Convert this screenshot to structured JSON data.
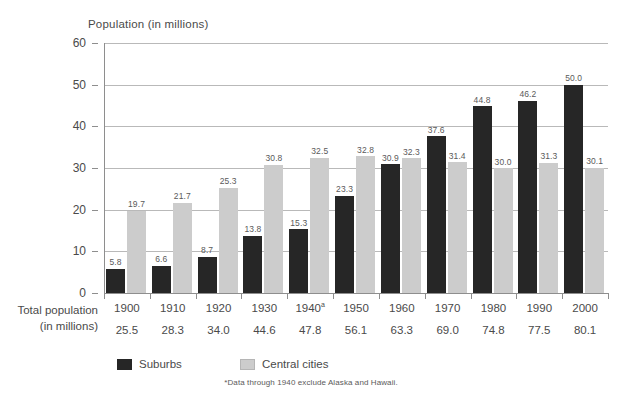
{
  "chart_data": {
    "type": "bar",
    "title": "Population (in millions)",
    "xlabel": "",
    "ylabel": "Population (in millions)",
    "ylim": [
      0,
      60
    ],
    "yticks": [
      0,
      10,
      20,
      30,
      40,
      50,
      60
    ],
    "grid": "horizontal",
    "legend_position": "bottom",
    "categories": [
      "1900",
      "1910",
      "1920",
      "1930",
      "1940",
      "1950",
      "1960",
      "1970",
      "1980",
      "1990",
      "2000"
    ],
    "category_labels": [
      "1900",
      "1910",
      "1920",
      "1930",
      "1940a",
      "1950",
      "1960",
      "1970",
      "1980",
      "1990",
      "2000"
    ],
    "series": [
      {
        "name": "Suburbs",
        "color": "#262626",
        "values": [
          5.8,
          6.6,
          8.7,
          13.8,
          15.3,
          23.3,
          30.9,
          37.6,
          44.8,
          46.2,
          50.0
        ],
        "labels": [
          "5.8",
          "6.6",
          "8.7",
          "13.8",
          "15.3",
          "23.3",
          "30.9",
          "37.6",
          "44.8",
          "46.2",
          "50.0"
        ]
      },
      {
        "name": "Central cities",
        "color": "#cccccc",
        "values": [
          19.7,
          21.7,
          25.3,
          30.8,
          32.5,
          32.8,
          32.3,
          31.4,
          30.0,
          31.3,
          30.1
        ],
        "labels": [
          "19.7",
          "21.7",
          "25.3",
          "30.8",
          "32.5",
          "32.8",
          "32.3",
          "31.4",
          "30.0",
          "31.3",
          "30.1"
        ]
      }
    ],
    "totals_row": {
      "label_line1": "Total population",
      "label_line2": "(in millions)",
      "values": [
        25.5,
        28.3,
        34.0,
        44.6,
        47.8,
        56.1,
        63.3,
        69.0,
        74.8,
        77.5,
        80.1
      ],
      "labels": [
        "25.5",
        "28.3",
        "34.0",
        "44.6",
        "47.8",
        "56.1",
        "63.3",
        "69.0",
        "74.8",
        "77.5",
        "80.1"
      ]
    },
    "annotations": [
      "*Data through 1940 exclude Alaska and Hawaii."
    ],
    "footnote_marker": "a"
  },
  "legend": {
    "items": [
      {
        "label": "Suburbs",
        "color": "#262626"
      },
      {
        "label": "Central cities",
        "color": "#cccccc"
      }
    ]
  },
  "footnote": "*Data through 1940 exclude Alaska and Hawaii.",
  "colors": {
    "suburbs": "#262626",
    "central_cities": "#cccccc",
    "grid": "#b9b9b9",
    "axis": "#8e8e8e",
    "text": "#4a4a4a"
  }
}
